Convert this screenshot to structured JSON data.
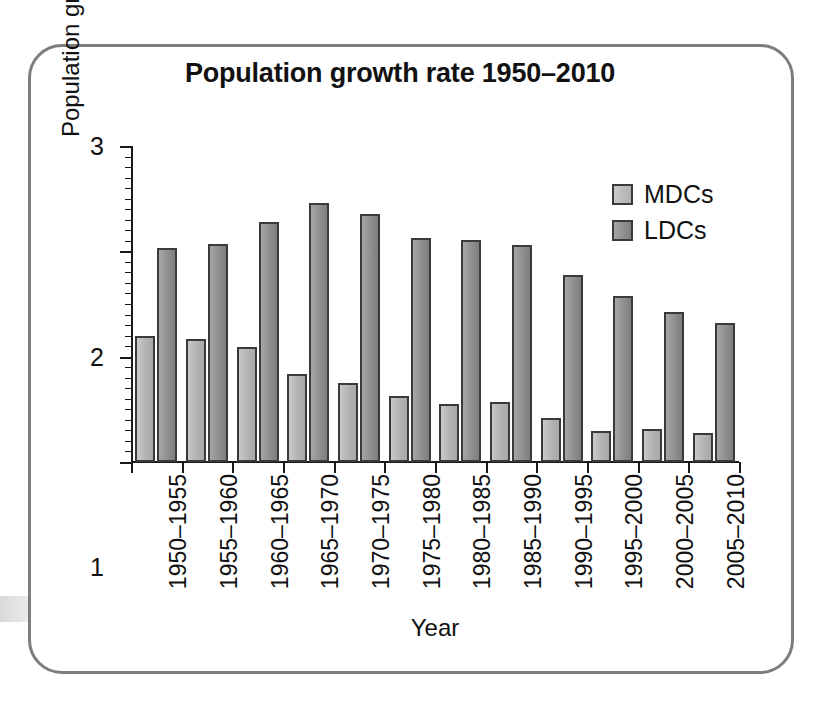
{
  "chart_data": {
    "type": "bar",
    "title": "Population growth rate 1950–2010",
    "xlabel": "Year",
    "ylabel": "Population growth rate (%)",
    "ylim": [
      0,
      3
    ],
    "yticks": [
      "0",
      "1",
      "2",
      "3"
    ],
    "grid": false,
    "legend_position": "top-right",
    "categories": [
      "1950–1955",
      "1955–1960",
      "1960–1965",
      "1965–1970",
      "1970–1975",
      "1975–1980",
      "1980–1985",
      "1985–1990",
      "1990–1995",
      "1995–2000",
      "2000–2005",
      "2005–2010"
    ],
    "series": [
      {
        "name": "MDCs",
        "color": "#b8b8b8",
        "values": [
          1.2,
          1.17,
          1.09,
          0.84,
          0.75,
          0.63,
          0.55,
          0.57,
          0.42,
          0.29,
          0.31,
          0.28
        ]
      },
      {
        "name": "LDCs",
        "color": "#8c8c8c",
        "values": [
          2.03,
          2.07,
          2.28,
          2.46,
          2.35,
          2.13,
          2.11,
          2.06,
          1.78,
          1.58,
          1.42,
          1.32
        ]
      }
    ]
  },
  "legend": {
    "items": [
      {
        "label": "MDCs"
      },
      {
        "label": "LDCs"
      }
    ]
  },
  "frame": {
    "border_color": "#7d7d7d"
  }
}
